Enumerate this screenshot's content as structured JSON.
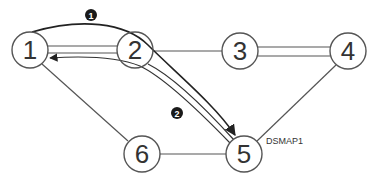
{
  "diagram": {
    "type": "network-topology",
    "colors": {
      "background": "#ffffff",
      "node_stroke": "#555555",
      "link_stroke": "#555555",
      "path_stroke": "#333333",
      "badge_fill": "#1a1a1a"
    },
    "nodes": [
      {
        "id": "1",
        "label": "1",
        "x": 30,
        "y": 50
      },
      {
        "id": "2",
        "label": "2",
        "x": 135,
        "y": 50
      },
      {
        "id": "3",
        "label": "3",
        "x": 240,
        "y": 51
      },
      {
        "id": "4",
        "label": "4",
        "x": 348,
        "y": 51
      },
      {
        "id": "5",
        "label": "5",
        "x": 244,
        "y": 154
      },
      {
        "id": "6",
        "label": "6",
        "x": 142,
        "y": 154
      }
    ],
    "links": [
      {
        "from": "1",
        "to": "2",
        "style": "double"
      },
      {
        "from": "2",
        "to": "3",
        "style": "single"
      },
      {
        "from": "3",
        "to": "4",
        "style": "double"
      },
      {
        "from": "4",
        "to": "5",
        "style": "single"
      },
      {
        "from": "2",
        "to": "5",
        "style": "double"
      },
      {
        "from": "1",
        "to": "6",
        "style": "single"
      },
      {
        "from": "6",
        "to": "5",
        "style": "single"
      }
    ],
    "paths": [
      {
        "id": "1",
        "badge": "1",
        "description": "Path from node 1 over node 2 to node 5"
      },
      {
        "id": "2",
        "badge": "2",
        "description": "Path from node 5 via node 2 back to node 1"
      }
    ],
    "annotations": {
      "node5_tag": "DSMAP1",
      "badge1": "1",
      "badge2": "2"
    }
  }
}
